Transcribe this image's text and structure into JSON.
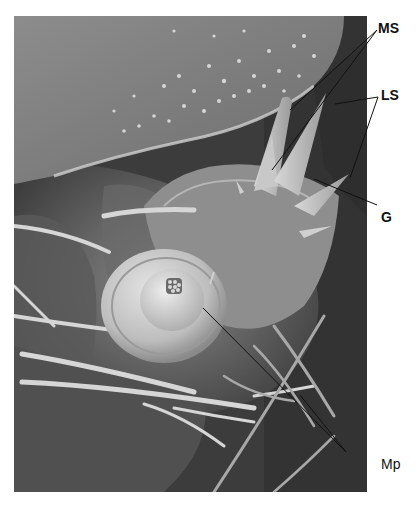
{
  "figure": {
    "type": "scanning electron micrograph",
    "labels": [
      {
        "id": "MS",
        "text": "MS",
        "x": 378,
        "y": 21
      },
      {
        "id": "LS",
        "text": "LS",
        "x": 381,
        "y": 88
      },
      {
        "id": "G",
        "text": "G",
        "x": 381,
        "y": 210
      },
      {
        "id": "Mp",
        "text": "Mp",
        "x": 381,
        "y": 457
      }
    ],
    "leaders": {
      "MS": [
        [
          377,
          30,
          290,
          110
        ],
        [
          377,
          30,
          272,
          170
        ]
      ],
      "LS": [
        [
          378,
          97,
          335,
          104
        ],
        [
          378,
          97,
          350,
          178
        ]
      ],
      "G": [
        [
          377,
          205,
          314,
          179
        ]
      ],
      "Mp": [
        [
          346,
          452,
          203,
          308
        ],
        [
          346,
          452,
          300,
          395
        ]
      ]
    }
  }
}
